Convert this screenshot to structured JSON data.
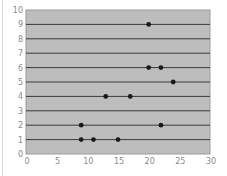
{
  "chart_data": {
    "type": "scatter",
    "title": "",
    "xlabel": "",
    "ylabel": "",
    "xlim": [
      0,
      30
    ],
    "ylim": [
      0,
      10
    ],
    "x_ticks": [
      0,
      5,
      10,
      15,
      20,
      25,
      30
    ],
    "y_ticks": [
      0,
      1,
      2,
      3,
      4,
      5,
      6,
      7,
      8,
      9,
      10
    ],
    "grid": {
      "horizontal": true,
      "vertical": false
    },
    "legend": null,
    "series": [
      {
        "name": "points",
        "points": [
          {
            "x": 20,
            "y": 9
          },
          {
            "x": 20,
            "y": 6
          },
          {
            "x": 22,
            "y": 6
          },
          {
            "x": 24,
            "y": 5
          },
          {
            "x": 13,
            "y": 4
          },
          {
            "x": 17,
            "y": 4
          },
          {
            "x": 9,
            "y": 2
          },
          {
            "x": 22,
            "y": 2
          },
          {
            "x": 9,
            "y": 1
          },
          {
            "x": 11,
            "y": 1
          },
          {
            "x": 15,
            "y": 1
          }
        ]
      }
    ]
  },
  "colors": {
    "plot_background": "#bdbdbd",
    "gridline": "#3a3a3a",
    "marker": "#1a1a1a",
    "tick_label": "#8a8a8a",
    "axis_border": "#9a9a9a"
  }
}
